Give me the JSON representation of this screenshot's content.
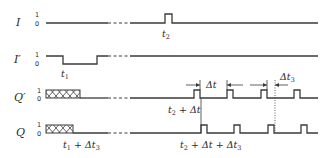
{
  "diagram": {
    "signals": [
      {
        "name": "I",
        "level_high": "1",
        "level_low": "0"
      },
      {
        "name": "I′",
        "level_high": "1",
        "level_low": "0"
      },
      {
        "name": "Q′",
        "level_high": "1",
        "level_low": "0"
      },
      {
        "name": "Q",
        "level_high": "1",
        "level_low": "0"
      }
    ],
    "annotations": {
      "t2": {
        "main": "t",
        "sub": "2"
      },
      "t1": {
        "main": "t",
        "sub": "1"
      },
      "t2_dt": {
        "a": "t",
        "a_sub": "2",
        "b": " + Δt"
      },
      "t1_dt3": {
        "a": "t",
        "a_sub": "1",
        "b": " + Δt",
        "b_sub": "3"
      },
      "t2_dt_dt3": {
        "a": "t",
        "a_sub": "2",
        "b": " + Δt + Δt",
        "b_sub": "3"
      },
      "delta_t": "Δt",
      "delta_t3": {
        "main": "Δt",
        "sub": "3"
      }
    },
    "colors": {
      "line": "#3a3a3a",
      "text": "#2a2a2a",
      "background": "#ffffff"
    }
  }
}
